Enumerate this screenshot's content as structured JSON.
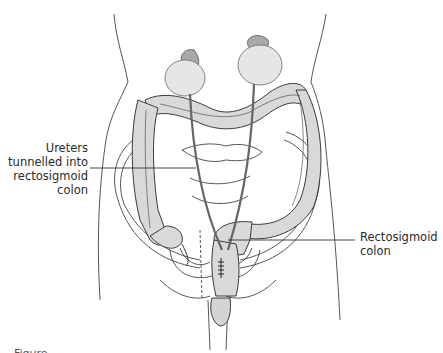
{
  "figure": {
    "colors": {
      "organ_fill": "#d9d9d9",
      "organ_fill_light": "#e8e8e8",
      "outline": "#3a3a3a",
      "body_outline": "#555555",
      "leader_line": "#333333",
      "text": "#2a2a2a"
    },
    "labels": [
      {
        "id": "ureters",
        "lines": [
          "Ureters",
          "tunnelled into",
          "rectosigmoid",
          "colon"
        ]
      },
      {
        "id": "rectosigmoid",
        "lines": [
          "Rectosigmoid",
          "colon"
        ]
      }
    ],
    "structures": [
      "kidney-left",
      "kidney-right",
      "adrenal-left",
      "adrenal-right",
      "ureter-left",
      "ureter-right",
      "ascending-colon",
      "transverse-colon",
      "descending-colon",
      "sigmoid-colon",
      "rectum",
      "pelvis",
      "bladder",
      "urethra",
      "body-outline"
    ],
    "caption_partial": "Figure"
  }
}
